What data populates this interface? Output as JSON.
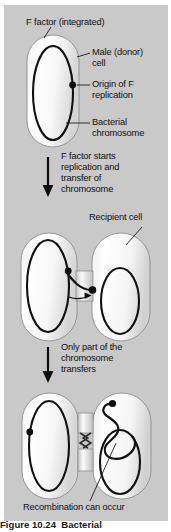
{
  "figure": {
    "background_color": "#c9c9c9",
    "page_color": "#ffffff",
    "ink_color": "#101010",
    "cell_fill_light": "#fdfdfd",
    "cell_fill_shadow": "#d8d8d8"
  },
  "labels": {
    "f_factor": "F factor (integrated)",
    "male_cell_line1": "Male (donor)",
    "male_cell_line2": "cell",
    "origin_line1": "Origin of F",
    "origin_line2": "replication",
    "chromosome_line1": "Bacterial",
    "chromosome_line2": "chromosome",
    "recipient_cell": "Recipient cell",
    "recombination": "Recombination can occur"
  },
  "steps": [
    {
      "id": "step-1-transfer-start",
      "lines": [
        "F factor starts",
        "replication and",
        "transfer of",
        "chromosome"
      ]
    },
    {
      "id": "step-2-partial-transfer",
      "lines": [
        "Only part of the",
        "chromosome",
        "transfers"
      ]
    }
  ],
  "stages": [
    {
      "id": "stage-donor-cell",
      "name": "Male (donor) cell with integrated F factor"
    },
    {
      "id": "stage-conjugation",
      "name": "Donor and recipient cells joined by conjugation bridge"
    },
    {
      "id": "stage-recombination",
      "name": "Partial chromosome transfer and recombination"
    }
  ],
  "caption": "Figure 10.24  Bacterial"
}
